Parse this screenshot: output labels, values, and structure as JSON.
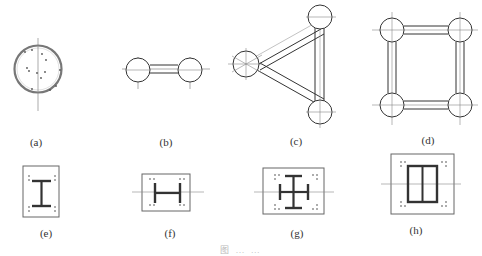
{
  "figure": {
    "panels": [
      {
        "id": "a",
        "label": "(a)",
        "desc": "solid circular column section with scattered aggregate"
      },
      {
        "id": "b",
        "label": "(b)",
        "desc": "two-limb lattice column, circles connected by parallel bars"
      },
      {
        "id": "c",
        "label": "(c)",
        "desc": "three-limb triangular lattice column"
      },
      {
        "id": "d",
        "label": "(d)",
        "desc": "four-limb square lattice column"
      },
      {
        "id": "e",
        "label": "(e)",
        "desc": "I-section steel encased in rectangle"
      },
      {
        "id": "f",
        "label": "(f)",
        "desc": "H-section steel encased in rectangle"
      },
      {
        "id": "g",
        "label": "(g)",
        "desc": "cross-shaped built-up steel section encased in rectangle"
      },
      {
        "id": "h",
        "label": "(h)",
        "desc": "box steel section encased in rectangle"
      }
    ],
    "caption": "图 … …"
  },
  "colors": {
    "stroke": "#333333",
    "centerline": "#888888",
    "background": "#ffffff"
  }
}
